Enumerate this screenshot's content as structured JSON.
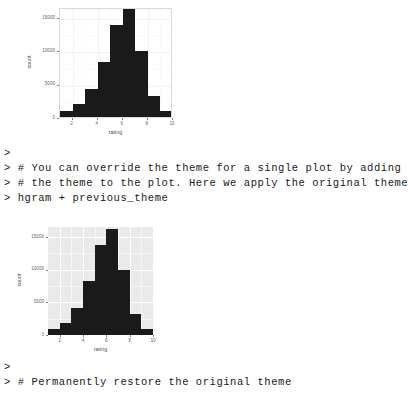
{
  "session": {
    "prompt": ">",
    "blocks": [
      {
        "name": "console-block-middle",
        "lines": [
          ">",
          "> # You can override the theme for a single plot by adding",
          "> # the theme to the plot. Here we apply the original theme",
          "> hgram + previous_theme"
        ]
      },
      {
        "name": "console-block-bottom",
        "lines": [
          ">",
          "> # Permanently restore the original theme"
        ]
      }
    ]
  },
  "colors": {
    "bar_fill": "#1a1a1a",
    "panel_bw_background": "#ffffff",
    "panel_bw_border": "#d9d9d9",
    "panel_grey_background": "#eaeaea",
    "gridline_white": "#ffffff",
    "axis_text": "#666666",
    "axis_title": "#4d4d4d",
    "page_background": "#ffffff"
  },
  "chart_data": [
    {
      "id": "histogram-bw-theme",
      "type": "bar",
      "title": "",
      "xlabel": "rating",
      "ylabel": "count",
      "theme": "theme_bw",
      "xlim": [
        1,
        10
      ],
      "ylim": [
        0,
        16500
      ],
      "grid": true,
      "legend": "none",
      "binwidth": 1,
      "x_ticks": [
        2,
        4,
        6,
        8,
        10
      ],
      "y_ticks": [
        0,
        5000,
        10000,
        15000
      ],
      "x_tick_labels": [
        "2",
        "4",
        "6",
        "8",
        "10"
      ],
      "y_tick_labels": [
        "0",
        "5000",
        "10000",
        "15000"
      ],
      "bin_starts": [
        1,
        2,
        3,
        4,
        5,
        6,
        7,
        8,
        9
      ],
      "values": [
        900,
        1900,
        4200,
        8200,
        13800,
        16200,
        9900,
        3200,
        850
      ]
    },
    {
      "id": "histogram-grey-theme",
      "type": "bar",
      "title": "",
      "xlabel": "rating",
      "ylabel": "count",
      "theme": "theme_grey",
      "xlim": [
        1,
        10
      ],
      "ylim": [
        0,
        16500
      ],
      "grid": true,
      "legend": "none",
      "binwidth": 1,
      "x_ticks": [
        2,
        4,
        6,
        8,
        10
      ],
      "y_ticks": [
        0,
        5000,
        10000,
        15000
      ],
      "x_tick_labels": [
        "2",
        "4",
        "6",
        "8",
        "10"
      ],
      "y_tick_labels": [
        "0",
        "5000",
        "10000",
        "15000"
      ],
      "bin_starts": [
        1,
        2,
        3,
        4,
        5,
        6,
        7,
        8,
        9
      ],
      "values": [
        900,
        1900,
        4200,
        8200,
        13800,
        16200,
        9900,
        3200,
        850
      ]
    }
  ]
}
